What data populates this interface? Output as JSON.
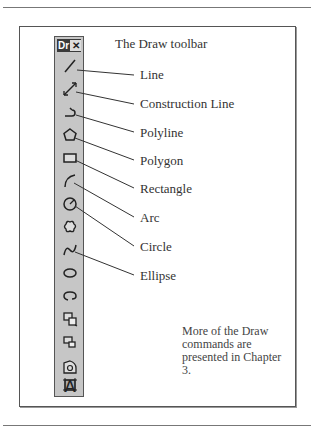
{
  "title": "The Draw toolbar",
  "toolbar": {
    "title_abbrev": "Dr",
    "close_glyph": "✕",
    "tools": [
      {
        "name": "line-icon"
      },
      {
        "name": "construction-line-icon"
      },
      {
        "name": "polyline-icon"
      },
      {
        "name": "polygon-icon"
      },
      {
        "name": "rectangle-icon"
      },
      {
        "name": "arc-icon"
      },
      {
        "name": "circle-icon"
      },
      {
        "name": "revision-cloud-icon"
      },
      {
        "name": "spline-icon"
      },
      {
        "name": "ellipse-icon"
      },
      {
        "name": "ellipse-arc-icon"
      },
      {
        "name": "insert-block-icon"
      },
      {
        "name": "make-block-icon"
      },
      {
        "name": "point-icon"
      },
      {
        "name": "hatch-icon"
      },
      {
        "name": "region-icon"
      },
      {
        "name": "multiline-text-icon",
        "glyph": "A"
      }
    ]
  },
  "labels": {
    "line": "Line",
    "construction_line": "Construction Line",
    "polyline": "Polyline",
    "polygon": "Polygon",
    "rectangle": "Rectangle",
    "arc": "Arc",
    "circle": "Circle",
    "ellipse": "Ellipse"
  },
  "note": "More of the Draw commands are presented in Chapter 3."
}
